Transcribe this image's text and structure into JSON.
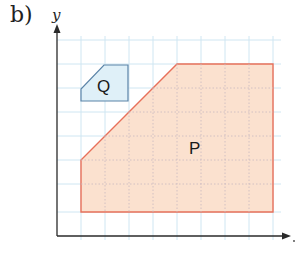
{
  "figure": {
    "part_label": "b)",
    "y_axis_label": "y",
    "x_axis_label": "x",
    "colors": {
      "grid": "#cfe6f2",
      "axis": "#2a2a2a",
      "shape_P_fill": "#fbe1cf",
      "shape_P_stroke": "#e8705a",
      "shape_Q_fill": "#dff0f8",
      "shape_Q_stroke": "#5b84a8"
    },
    "grid": {
      "cell_px": 24,
      "columns": 9,
      "rows": 8
    },
    "shapes": [
      {
        "name": "P",
        "label": "P",
        "vertices_grid": [
          [
            1,
            3
          ],
          [
            1,
            1
          ],
          [
            9,
            1
          ],
          [
            9,
            7
          ],
          [
            5,
            7
          ]
        ]
      },
      {
        "name": "Q",
        "label": "Q",
        "vertices_grid": [
          [
            1,
            5.5
          ],
          [
            1,
            5
          ],
          [
            3,
            5
          ],
          [
            3,
            6.5
          ],
          [
            2,
            6.5
          ]
        ]
      }
    ]
  }
}
